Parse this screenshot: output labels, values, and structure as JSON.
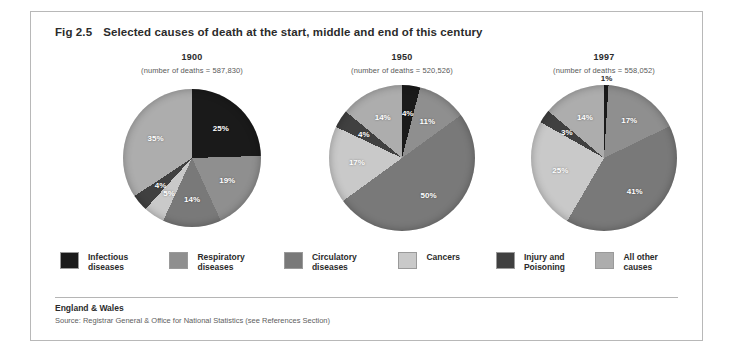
{
  "figure": {
    "number": "Fig 2.5",
    "title": "Selected causes of death at the start, middle and end of this century"
  },
  "footer": {
    "region": "England & Wales",
    "source": "Source:  Registrar General &  Office for National Statistics (see References Section)"
  },
  "legend": {
    "items": [
      {
        "label": "Infectious\ndiseases",
        "color": "#1a1a1a"
      },
      {
        "label": "Respiratory\ndiseases",
        "color": "#8f8f8f"
      },
      {
        "label": "Circulatory\ndiseases",
        "color": "#797979"
      },
      {
        "label": "Cancers",
        "color": "#c9c9c9"
      },
      {
        "label": "Injury and\nPoisoning",
        "color": "#404040"
      },
      {
        "label": "All other\ncauses",
        "color": "#adadad"
      }
    ]
  },
  "panels": [
    {
      "year": "1900",
      "subtitle": "(number of deaths = 587,830)"
    },
    {
      "year": "1950",
      "subtitle": "(number of deaths = 520,526)"
    },
    {
      "year": "1997",
      "subtitle": "(number of deaths = 558,052)"
    }
  ],
  "chart_data": [
    {
      "type": "pie",
      "title": "1900",
      "subtitle": "(number of deaths = 587,830)",
      "total_deaths": 587830,
      "legend_position": "bottom-shared",
      "categories": [
        "Infectious diseases",
        "Respiratory diseases",
        "Circulatory diseases",
        "Cancers",
        "Injury and Poisoning",
        "All other causes"
      ],
      "values": [
        25,
        19,
        14,
        5,
        4,
        35
      ],
      "labels": [
        "25%",
        "19%",
        "14%",
        "5%",
        "4%",
        "35%"
      ],
      "colors": [
        "#1a1a1a",
        "#8f8f8f",
        "#797979",
        "#c9c9c9",
        "#404040",
        "#adadad"
      ],
      "unit": "percent"
    },
    {
      "type": "pie",
      "title": "1950",
      "subtitle": "(number of deaths = 520,526)",
      "total_deaths": 520526,
      "legend_position": "bottom-shared",
      "categories": [
        "Infectious diseases",
        "Respiratory diseases",
        "Circulatory diseases",
        "Cancers",
        "Injury and Poisoning",
        "All other causes"
      ],
      "values": [
        4,
        11,
        50,
        17,
        4,
        14
      ],
      "labels": [
        "4%",
        "11%",
        "50%",
        "17%",
        "4%",
        "14%"
      ],
      "colors": [
        "#1a1a1a",
        "#8f8f8f",
        "#797979",
        "#c9c9c9",
        "#404040",
        "#adadad"
      ],
      "unit": "percent"
    },
    {
      "type": "pie",
      "title": "1997",
      "subtitle": "(number of deaths = 558,052)",
      "total_deaths": 558052,
      "legend_position": "bottom-shared",
      "categories": [
        "Infectious diseases",
        "Respiratory diseases",
        "Circulatory diseases",
        "Cancers",
        "Injury and Poisoning",
        "All other causes"
      ],
      "values": [
        1,
        17,
        41,
        25,
        3,
        14
      ],
      "labels": [
        "1%",
        "17%",
        "41%",
        "25%",
        "3%",
        "14%"
      ],
      "colors": [
        "#1a1a1a",
        "#8f8f8f",
        "#797979",
        "#c9c9c9",
        "#404040",
        "#adadad"
      ],
      "unit": "percent"
    }
  ]
}
